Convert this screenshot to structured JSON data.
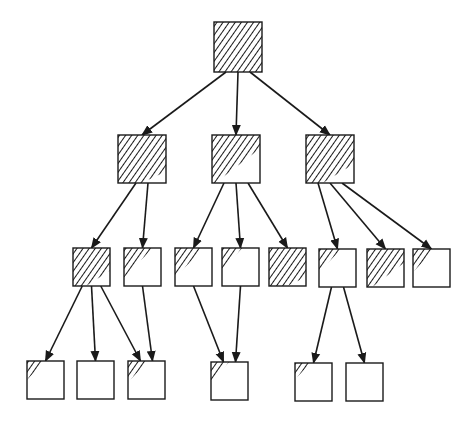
{
  "diagram": {
    "type": "tree",
    "colors": {
      "stroke": "#1a1a1a",
      "background": "#ffffff"
    },
    "nodes": [
      {
        "id": "root",
        "level": 0,
        "x": 214,
        "y": 22,
        "w": 48,
        "h": 50,
        "fill": 1.0
      },
      {
        "id": "L1-a",
        "level": 1,
        "x": 118,
        "y": 135,
        "w": 48,
        "h": 48,
        "fill": 0.85
      },
      {
        "id": "L1-b",
        "level": 1,
        "x": 212,
        "y": 135,
        "w": 48,
        "h": 48,
        "fill": 0.55
      },
      {
        "id": "L1-c",
        "level": 1,
        "x": 306,
        "y": 135,
        "w": 48,
        "h": 48,
        "fill": 0.75
      },
      {
        "id": "L2-1",
        "level": 2,
        "x": 73,
        "y": 248,
        "w": 37,
        "h": 38,
        "fill": 0.75
      },
      {
        "id": "L2-2",
        "level": 2,
        "x": 124,
        "y": 248,
        "w": 37,
        "h": 38,
        "fill": 0.5
      },
      {
        "id": "L2-3",
        "level": 2,
        "x": 175,
        "y": 248,
        "w": 37,
        "h": 38,
        "fill": 0.5
      },
      {
        "id": "L2-4",
        "level": 2,
        "x": 222,
        "y": 248,
        "w": 37,
        "h": 38,
        "fill": 0.25
      },
      {
        "id": "L2-5",
        "level": 2,
        "x": 269,
        "y": 248,
        "w": 37,
        "h": 38,
        "fill": 0.85
      },
      {
        "id": "L2-6",
        "level": 2,
        "x": 319,
        "y": 249,
        "w": 37,
        "h": 38,
        "fill": 0.3
      },
      {
        "id": "L2-7",
        "level": 2,
        "x": 367,
        "y": 249,
        "w": 37,
        "h": 38,
        "fill": 0.6
      },
      {
        "id": "L2-8",
        "level": 2,
        "x": 413,
        "y": 249,
        "w": 37,
        "h": 38,
        "fill": 0.3
      },
      {
        "id": "L3-1",
        "level": 3,
        "x": 27,
        "y": 361,
        "w": 37,
        "h": 38,
        "fill": 0.2
      },
      {
        "id": "L3-2",
        "level": 3,
        "x": 77,
        "y": 361,
        "w": 37,
        "h": 38,
        "fill": 0.0
      },
      {
        "id": "L3-3",
        "level": 3,
        "x": 128,
        "y": 361,
        "w": 37,
        "h": 38,
        "fill": 0.25
      },
      {
        "id": "L3-4",
        "level": 3,
        "x": 211,
        "y": 362,
        "w": 37,
        "h": 38,
        "fill": 0.2
      },
      {
        "id": "L3-5",
        "level": 3,
        "x": 295,
        "y": 363,
        "w": 37,
        "h": 38,
        "fill": 0.15
      },
      {
        "id": "L3-6",
        "level": 3,
        "x": 346,
        "y": 363,
        "w": 37,
        "h": 38,
        "fill": 0.0
      }
    ],
    "edges": [
      {
        "from": "root",
        "to": "L1-a"
      },
      {
        "from": "root",
        "to": "L1-b"
      },
      {
        "from": "root",
        "to": "L1-c"
      },
      {
        "from": "L1-a",
        "to": "L2-1"
      },
      {
        "from": "L1-a",
        "to": "L2-2"
      },
      {
        "from": "L1-b",
        "to": "L2-3"
      },
      {
        "from": "L1-b",
        "to": "L2-4"
      },
      {
        "from": "L1-b",
        "to": "L2-5"
      },
      {
        "from": "L1-c",
        "to": "L2-6"
      },
      {
        "from": "L1-c",
        "to": "L2-7"
      },
      {
        "from": "L1-c",
        "to": "L2-8"
      },
      {
        "from": "L2-1",
        "to": "L3-1"
      },
      {
        "from": "L2-1",
        "to": "L3-2"
      },
      {
        "from": "L2-1",
        "to": "L3-3"
      },
      {
        "from": "L2-2",
        "to": "L3-3"
      },
      {
        "from": "L2-3",
        "to": "L3-4"
      },
      {
        "from": "L2-4",
        "to": "L3-4"
      },
      {
        "from": "L2-6",
        "to": "L3-5"
      },
      {
        "from": "L2-6",
        "to": "L3-6"
      }
    ]
  }
}
